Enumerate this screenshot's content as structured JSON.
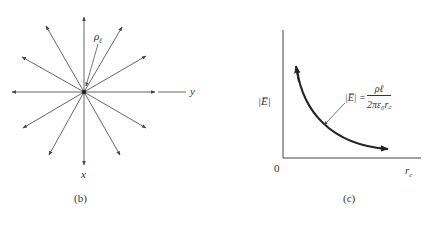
{
  "panel_b": {
    "caption": "(b)",
    "axis_x_label": "x",
    "axis_y_label": "y",
    "charge_label": "ρ",
    "charge_sub": "ℓ"
  },
  "panel_c": {
    "caption": "(c)",
    "y_axis_label": "|E̅|",
    "x_axis_label": "r",
    "x_axis_sub": "c",
    "origin_label": "0",
    "formula_lhs": "|E̅| =",
    "formula_num": "ρℓ",
    "formula_den": "2πε₀r꜀"
  },
  "colors": {
    "line": "#555555",
    "curve": "#222222"
  }
}
